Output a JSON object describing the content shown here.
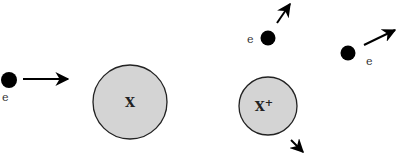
{
  "diagram": {
    "before": {
      "electron_label": "e",
      "atom_label": "X"
    },
    "after": {
      "electron1_label": "e",
      "electron2_label": "e",
      "ion_label": "X",
      "ion_charge": "+"
    },
    "colors": {
      "electron": "#000000",
      "atom_fill": "#d4d4d4",
      "atom_stroke": "#222222",
      "arrow": "#000000"
    }
  }
}
